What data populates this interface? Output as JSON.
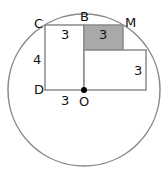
{
  "diagram": {
    "points": {
      "C": "C",
      "B": "B",
      "M": "M",
      "D": "D",
      "O": "O"
    },
    "lengths": {
      "left_rect_top": "3",
      "left_rect_side": "4",
      "left_rect_bottom": "3",
      "shaded_square": "3",
      "right_rect_side": "3"
    },
    "colors": {
      "stroke": "#8a8a8a",
      "shaded_fill": "#a9a9a9",
      "center_dot": "#000000"
    }
  }
}
